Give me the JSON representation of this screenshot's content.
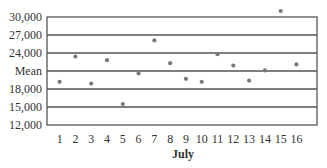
{
  "chart_data": {
    "type": "scatter",
    "title": "",
    "xlabel": "July",
    "ylabel": "",
    "x": [
      1,
      2,
      3,
      4,
      5,
      6,
      7,
      8,
      9,
      10,
      11,
      12,
      13,
      14,
      15,
      16
    ],
    "series": [
      {
        "name": "Daily values",
        "values": [
          19200,
          23400,
          18900,
          22800,
          15500,
          20600,
          26100,
          22300,
          19700,
          19200,
          23800,
          21900,
          19400,
          21100,
          31000,
          22100
        ]
      }
    ],
    "x_tick_labels": [
      "1",
      "2",
      "3",
      "4",
      "5",
      "6",
      "7",
      "8",
      "9",
      "10",
      "11",
      "12",
      "13",
      "14",
      "15",
      "16"
    ],
    "y_ticks": [
      12000,
      15000,
      18000,
      21000,
      24000,
      27000,
      30000
    ],
    "y_tick_labels": [
      "12,000",
      "15,000",
      "18,000",
      "Mean",
      "24,000",
      "27,000",
      "30,000"
    ],
    "ylim": [
      12000,
      30000
    ],
    "xlim": [
      0.2,
      17.3
    ],
    "grid": true,
    "legend": "none",
    "annotations": [
      "Mean line at 21,000"
    ],
    "colors": {
      "line": "#555555",
      "point": "#7a7a7a",
      "text": "#333333"
    }
  }
}
